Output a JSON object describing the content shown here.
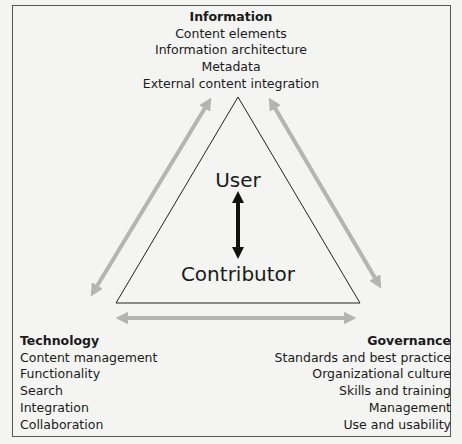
{
  "diagram": {
    "information": {
      "title": "Information",
      "items": [
        "Content elements",
        "Information architecture",
        "Metadata",
        "External content integration"
      ]
    },
    "technology": {
      "title": "Technology",
      "items": [
        "Content management",
        "Functionality",
        "Search",
        "Integration",
        "Collaboration"
      ]
    },
    "governance": {
      "title": "Governance",
      "items": [
        "Standards and best practice",
        "Organizational culture",
        "Skills and training",
        "Management",
        "Use and usability"
      ]
    },
    "center": {
      "top_label": "User",
      "bottom_label": "Contributor"
    },
    "colors": {
      "arrow_gray": "#b4b4b4",
      "arrow_black": "#111111",
      "background": "#f4f4f2"
    }
  }
}
